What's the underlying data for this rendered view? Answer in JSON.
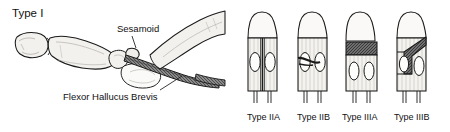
{
  "figure": {
    "title_label": "Type I",
    "background_color": "#ffffff",
    "ink_color": "#1a1a1a",
    "bone_fill_color": "#f2f1ee",
    "lesion_fill_color": "#6b6b6b"
  },
  "left_panel": {
    "name": "Type I lateral view of hallux with sesamoid",
    "type_label": "Type I",
    "annotations": [
      {
        "label": "Sesamoid",
        "target": "sesamoid-bone"
      },
      {
        "label": "Flexor Hallucus Brevis",
        "target": "flexor-tendon"
      }
    ]
  },
  "right_panel": {
    "name": "Sesamoid classification cross sections",
    "diagrams": [
      {
        "label": "Type IIA",
        "pattern": "complete-longitudinal-split"
      },
      {
        "label": "Type IIB",
        "pattern": "partial-oblique-lesion-medial"
      },
      {
        "label": "Type IIIA",
        "pattern": "complete-transverse-band-proximal"
      },
      {
        "label": "Type IIIB",
        "pattern": "oblique-diagonal-band"
      }
    ]
  }
}
